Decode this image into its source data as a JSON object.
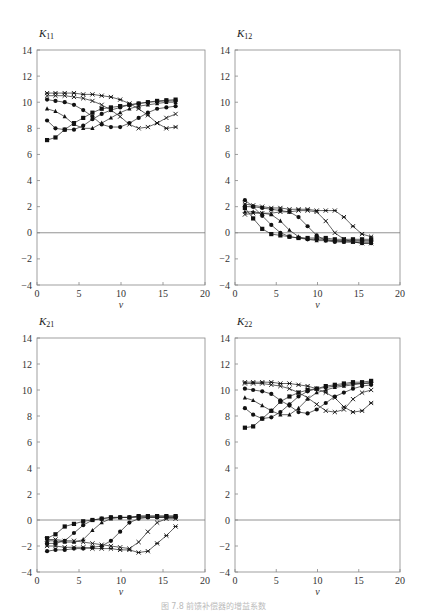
{
  "caption": "图 7.8  前馈补偿器的增益系数",
  "chart_data": [
    {
      "type": "line",
      "id": "K11",
      "title": "K11",
      "title_main": "K",
      "title_sub": "11",
      "xlabel": "v",
      "xlim": [
        0,
        20
      ],
      "ylim": [
        -4,
        14
      ],
      "xticks": [
        0,
        5,
        10,
        15,
        20
      ],
      "yticks": [
        14,
        12,
        10,
        8,
        6,
        4,
        2,
        0,
        -2,
        -4
      ],
      "zero_line": true,
      "x": [
        1.2,
        2.2,
        3.3,
        4.4,
        5.5,
        6.6,
        7.7,
        8.8,
        9.9,
        11,
        12.1,
        13.2,
        14.3,
        15.4,
        16.5
      ],
      "series": [
        {
          "name": "s1",
          "marker": "square",
          "values": [
            7.1,
            7.3,
            7.9,
            8.4,
            8.8,
            9.2,
            9.5,
            9.6,
            9.7,
            9.8,
            9.9,
            10.0,
            10.1,
            10.15,
            10.2
          ]
        },
        {
          "name": "s2",
          "marker": "circle",
          "values": [
            8.6,
            8.0,
            7.9,
            7.9,
            8.2,
            8.7,
            9.1,
            9.4,
            9.6,
            9.8,
            9.9,
            10.0,
            10.05,
            10.1,
            10.1
          ]
        },
        {
          "name": "s3",
          "marker": "triangle",
          "values": [
            9.5,
            9.3,
            8.9,
            8.3,
            8.0,
            8.0,
            8.4,
            8.8,
            9.2,
            9.5,
            9.7,
            9.8,
            9.9,
            10.0,
            10.0
          ]
        },
        {
          "name": "s4",
          "marker": "circle",
          "values": [
            10.2,
            10.1,
            10.0,
            9.8,
            9.4,
            8.9,
            8.3,
            8.1,
            8.1,
            8.4,
            8.8,
            9.2,
            9.5,
            9.6,
            9.7
          ]
        },
        {
          "name": "s5",
          "marker": "x",
          "values": [
            10.5,
            10.5,
            10.5,
            10.4,
            10.3,
            10.1,
            9.8,
            9.4,
            8.9,
            8.3,
            8.0,
            8.1,
            8.4,
            8.8,
            9.1
          ]
        },
        {
          "name": "s6",
          "marker": "asterisk",
          "values": [
            10.7,
            10.7,
            10.7,
            10.7,
            10.6,
            10.6,
            10.5,
            10.4,
            10.2,
            9.9,
            9.5,
            9.0,
            8.4,
            8.0,
            8.1
          ]
        }
      ]
    },
    {
      "type": "line",
      "id": "K12",
      "title": "K12",
      "title_main": "K",
      "title_sub": "12",
      "xlabel": "v",
      "xlim": [
        0,
        20
      ],
      "ylim": [
        -4,
        14
      ],
      "xticks": [
        0,
        5,
        10,
        15,
        20
      ],
      "yticks": [
        14,
        12,
        10,
        8,
        6,
        4,
        2,
        0,
        -2,
        -4
      ],
      "zero_line": true,
      "x": [
        1.2,
        2.2,
        3.3,
        4.4,
        5.5,
        6.6,
        7.7,
        8.8,
        9.9,
        11,
        12.1,
        13.2,
        14.3,
        15.4,
        16.5
      ],
      "series": [
        {
          "name": "s1",
          "marker": "square",
          "values": [
            1.9,
            1.1,
            0.3,
            -0.1,
            -0.2,
            -0.3,
            -0.4,
            -0.4,
            -0.4,
            -0.4,
            -0.5,
            -0.5,
            -0.5,
            -0.5,
            -0.5
          ]
        },
        {
          "name": "s2",
          "marker": "circle",
          "values": [
            2.5,
            2.0,
            1.3,
            0.6,
            0.0,
            -0.3,
            -0.4,
            -0.5,
            -0.5,
            -0.5,
            -0.6,
            -0.6,
            -0.6,
            -0.6,
            -0.6
          ]
        },
        {
          "name": "s3",
          "marker": "triangle",
          "values": [
            1.6,
            1.6,
            1.5,
            1.4,
            0.9,
            0.2,
            -0.3,
            -0.5,
            -0.6,
            -0.6,
            -0.6,
            -0.7,
            -0.7,
            -0.7,
            -0.7
          ]
        },
        {
          "name": "s4",
          "marker": "circle",
          "values": [
            2.0,
            2.0,
            1.9,
            1.8,
            1.7,
            1.6,
            1.2,
            0.5,
            -0.2,
            -0.6,
            -0.7,
            -0.7,
            -0.7,
            -0.8,
            -0.8
          ]
        },
        {
          "name": "s5",
          "marker": "x",
          "values": [
            1.4,
            1.5,
            1.5,
            1.5,
            1.6,
            1.6,
            1.7,
            1.7,
            1.6,
            0.9,
            0.0,
            -0.5,
            -0.7,
            -0.8,
            -0.8
          ]
        },
        {
          "name": "s6",
          "marker": "asterisk",
          "values": [
            2.2,
            2.1,
            2.0,
            1.9,
            1.9,
            1.8,
            1.8,
            1.8,
            1.7,
            1.7,
            1.7,
            1.2,
            0.5,
            -0.1,
            -0.3
          ]
        }
      ]
    },
    {
      "type": "line",
      "id": "K21",
      "title": "K21",
      "title_main": "K",
      "title_sub": "21",
      "xlabel": "v",
      "xlim": [
        0,
        20
      ],
      "ylim": [
        -4,
        14
      ],
      "xticks": [
        0,
        5,
        10,
        15,
        20
      ],
      "yticks": [
        14,
        12,
        10,
        8,
        6,
        4,
        2,
        0,
        -2,
        -4
      ],
      "zero_line": true,
      "x": [
        1.2,
        2.2,
        3.3,
        4.4,
        5.5,
        6.6,
        7.7,
        8.8,
        9.9,
        11,
        12.1,
        13.2,
        14.3,
        15.4,
        16.5
      ],
      "series": [
        {
          "name": "s1",
          "marker": "square",
          "values": [
            -1.4,
            -1.1,
            -0.5,
            -0.3,
            -0.1,
            0.0,
            0.1,
            0.2,
            0.2,
            0.2,
            0.3,
            0.3,
            0.3,
            0.3,
            0.3
          ]
        },
        {
          "name": "s2",
          "marker": "circle",
          "values": [
            -1.8,
            -1.8,
            -1.6,
            -1.0,
            -0.4,
            0.0,
            0.1,
            0.2,
            0.2,
            0.2,
            0.3,
            0.3,
            0.3,
            0.3,
            0.3
          ]
        },
        {
          "name": "s3",
          "marker": "triangle",
          "values": [
            -1.6,
            -1.6,
            -1.7,
            -1.7,
            -1.5,
            -0.8,
            -0.2,
            0.1,
            0.2,
            0.2,
            0.2,
            0.2,
            0.2,
            0.2,
            0.2
          ]
        },
        {
          "name": "s4",
          "marker": "circle",
          "values": [
            -2.4,
            -2.3,
            -2.3,
            -2.2,
            -2.2,
            -2.1,
            -2.0,
            -1.6,
            -0.9,
            -0.2,
            0.1,
            0.2,
            0.2,
            0.2,
            0.2
          ]
        },
        {
          "name": "s5",
          "marker": "x",
          "values": [
            -1.5,
            -1.5,
            -1.6,
            -1.6,
            -1.7,
            -1.8,
            -1.9,
            -2.0,
            -2.1,
            -2.2,
            -1.7,
            -0.9,
            -0.2,
            0.1,
            0.1
          ]
        },
        {
          "name": "s6",
          "marker": "asterisk",
          "values": [
            -2.0,
            -2.0,
            -2.1,
            -2.1,
            -2.1,
            -2.2,
            -2.2,
            -2.2,
            -2.3,
            -2.3,
            -2.5,
            -2.4,
            -1.8,
            -1.2,
            -0.5
          ]
        }
      ]
    },
    {
      "type": "line",
      "id": "K22",
      "title": "K22",
      "title_main": "K",
      "title_sub": "22",
      "xlabel": "v",
      "xlim": [
        0,
        20
      ],
      "ylim": [
        -4,
        14
      ],
      "xticks": [
        0,
        5,
        10,
        15,
        20
      ],
      "yticks": [
        14,
        12,
        10,
        8,
        6,
        4,
        2,
        0,
        -2,
        -4
      ],
      "zero_line": true,
      "x": [
        1.2,
        2.2,
        3.3,
        4.4,
        5.5,
        6.6,
        7.7,
        8.8,
        9.9,
        11,
        12.1,
        13.2,
        14.3,
        15.4,
        16.5
      ],
      "series": [
        {
          "name": "s1",
          "marker": "square",
          "values": [
            7.1,
            7.2,
            7.8,
            8.4,
            9.1,
            9.5,
            9.8,
            10.0,
            10.1,
            10.3,
            10.4,
            10.5,
            10.6,
            10.6,
            10.7
          ]
        },
        {
          "name": "s2",
          "marker": "circle",
          "values": [
            8.6,
            8.1,
            7.8,
            7.9,
            8.3,
            8.9,
            9.5,
            9.9,
            10.1,
            10.2,
            10.3,
            10.4,
            10.5,
            10.5,
            10.6
          ]
        },
        {
          "name": "s3",
          "marker": "triangle",
          "values": [
            9.4,
            9.2,
            8.8,
            8.4,
            8.1,
            8.1,
            8.6,
            9.3,
            9.8,
            10.0,
            10.2,
            10.3,
            10.4,
            10.5,
            10.5
          ]
        },
        {
          "name": "s4",
          "marker": "circle",
          "values": [
            10.1,
            10.0,
            9.9,
            9.7,
            9.2,
            8.8,
            8.3,
            8.2,
            8.5,
            9.0,
            9.5,
            9.8,
            10.1,
            10.3,
            10.4
          ]
        },
        {
          "name": "s5",
          "marker": "x",
          "values": [
            10.5,
            10.5,
            10.5,
            10.4,
            10.3,
            10.1,
            9.8,
            9.4,
            8.9,
            8.4,
            8.3,
            8.5,
            9.3,
            9.8,
            10.0
          ]
        },
        {
          "name": "s6",
          "marker": "asterisk",
          "values": [
            10.6,
            10.6,
            10.6,
            10.6,
            10.5,
            10.5,
            10.4,
            10.3,
            10.1,
            9.8,
            9.4,
            8.7,
            8.3,
            8.4,
            9.0
          ]
        }
      ]
    }
  ]
}
